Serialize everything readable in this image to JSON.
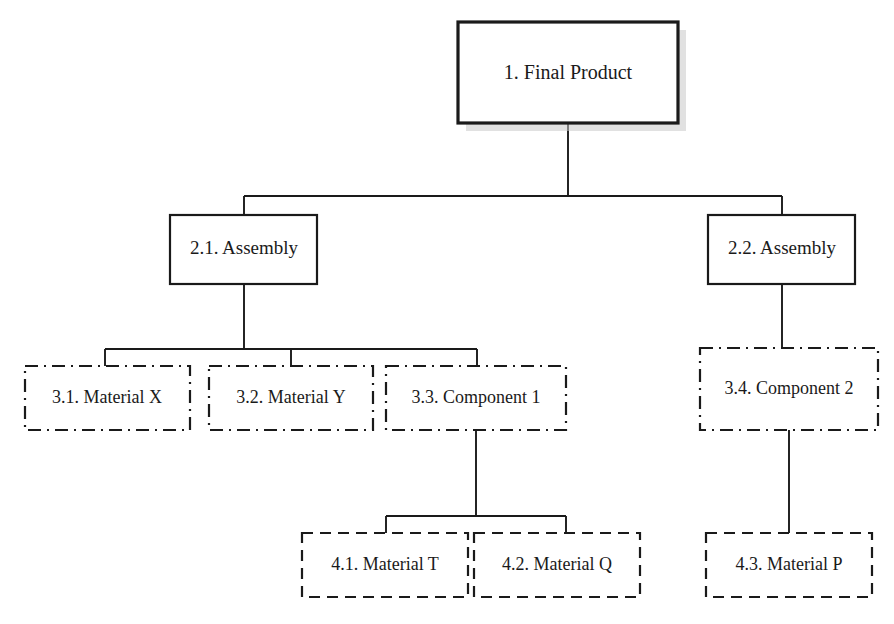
{
  "diagram": {
    "type": "hierarchy-tree",
    "canvas": {
      "width": 894,
      "height": 624,
      "background": "#ffffff"
    },
    "colors": {
      "stroke": "#1a1a1a",
      "fill": "#ffffff",
      "shadow": "#c9c9c9",
      "text": "#1a1a1a"
    },
    "nodes": [
      {
        "id": "n1",
        "label": "1. Final Product",
        "level": 1,
        "border": "solid-heavy",
        "shadow": true,
        "x": 458,
        "y": 22,
        "w": 220,
        "h": 101
      },
      {
        "id": "n21",
        "label": "2.1. Assembly",
        "level": 2,
        "border": "solid",
        "shadow": false,
        "x": 170,
        "y": 215,
        "w": 147,
        "h": 69
      },
      {
        "id": "n22",
        "label": "2.2. Assembly",
        "level": 2,
        "border": "solid",
        "shadow": false,
        "x": 708,
        "y": 215,
        "w": 147,
        "h": 69
      },
      {
        "id": "n31",
        "label": "3.1. Material X",
        "level": 3,
        "border": "dash-dot",
        "shadow": false,
        "x": 25,
        "y": 366,
        "w": 165,
        "h": 64
      },
      {
        "id": "n32",
        "label": "3.2. Material Y",
        "level": 3,
        "border": "dash-dot",
        "shadow": false,
        "x": 209,
        "y": 366,
        "w": 164,
        "h": 64
      },
      {
        "id": "n33",
        "label": "3.3. Component 1",
        "level": 3,
        "border": "dash-dot",
        "shadow": false,
        "x": 386,
        "y": 366,
        "w": 180,
        "h": 64
      },
      {
        "id": "n34",
        "label": "3.4. Component 2",
        "level": 3,
        "border": "dash-dot",
        "shadow": false,
        "x": 700,
        "y": 348,
        "w": 178,
        "h": 82
      },
      {
        "id": "n41",
        "label": "4.1. Material T",
        "level": 4,
        "border": "dashed",
        "shadow": false,
        "x": 302,
        "y": 533,
        "w": 166,
        "h": 64
      },
      {
        "id": "n42",
        "label": "4.2. Material Q",
        "level": 4,
        "border": "dashed",
        "shadow": false,
        "x": 474,
        "y": 533,
        "w": 166,
        "h": 64
      },
      {
        "id": "n43",
        "label": "4.3. Material P",
        "level": 4,
        "border": "dashed",
        "shadow": false,
        "x": 706,
        "y": 533,
        "w": 166,
        "h": 64
      }
    ],
    "edges": [
      {
        "id": "e-root-bus",
        "from": "n1",
        "to": "level2-bus",
        "kind": "orthogonal"
      },
      {
        "id": "e-n1-n21",
        "from": "n1",
        "to": "n21",
        "kind": "orthogonal"
      },
      {
        "id": "e-n1-n22",
        "from": "n1",
        "to": "n22",
        "kind": "orthogonal"
      },
      {
        "id": "e-n21-n31",
        "from": "n21",
        "to": "n31",
        "kind": "orthogonal"
      },
      {
        "id": "e-n21-n32",
        "from": "n21",
        "to": "n32",
        "kind": "orthogonal"
      },
      {
        "id": "e-n21-n33",
        "from": "n21",
        "to": "n33",
        "kind": "orthogonal"
      },
      {
        "id": "e-n22-n34",
        "from": "n22",
        "to": "n34",
        "kind": "straight"
      },
      {
        "id": "e-n33-n41",
        "from": "n33",
        "to": "n41",
        "kind": "orthogonal"
      },
      {
        "id": "e-n33-n42",
        "from": "n33",
        "to": "n42",
        "kind": "orthogonal"
      },
      {
        "id": "e-n34-n43",
        "from": "n34",
        "to": "n43",
        "kind": "straight"
      }
    ]
  }
}
